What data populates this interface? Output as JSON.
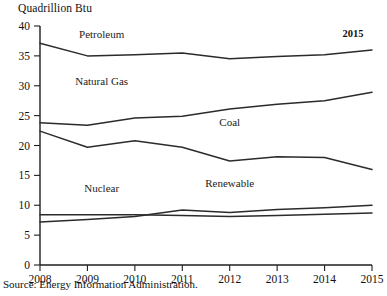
{
  "figure": {
    "unit_label": "Quadrillion Btu",
    "source_note": "Source: Energy Information Administration.",
    "end_year_annotation": "2015"
  },
  "chart_data": {
    "type": "line",
    "title": "",
    "subtitle": "",
    "xlabel": "",
    "ylabel": "Quadrillion Btu",
    "categories": [
      "2008",
      "2009",
      "2010",
      "2011",
      "2012",
      "2013",
      "2014",
      "2015"
    ],
    "x": [
      2008,
      2009,
      2010,
      2011,
      2012,
      2013,
      2014,
      2015
    ],
    "xlim": [
      2008,
      2015
    ],
    "ylim": [
      0,
      40
    ],
    "yticks": [
      0,
      5,
      10,
      15,
      20,
      25,
      30,
      35,
      40
    ],
    "ytick_labels": [
      "0",
      "5",
      "10",
      "15",
      "20",
      "25",
      "30",
      "35",
      "40"
    ],
    "xtick_labels": [
      "2008",
      "2009",
      "2010",
      "2011",
      "2012",
      "2013",
      "2014",
      "2015"
    ],
    "grid": false,
    "legend_position": "inline-labels",
    "annotations": [
      {
        "text": "2015",
        "x": 2014.6,
        "y": 38.2
      }
    ],
    "series": [
      {
        "name": "Petroleum",
        "label_x": 2009.3,
        "label_y": 38.0,
        "values": [
          37.1,
          35.0,
          35.2,
          35.5,
          34.5,
          34.9,
          35.2,
          36.0
        ]
      },
      {
        "name": "Natural Gas",
        "label_x": 2009.3,
        "label_y": 30.2,
        "values": [
          23.8,
          23.4,
          24.6,
          24.9,
          26.1,
          26.9,
          27.5,
          28.9
        ]
      },
      {
        "name": "Coal",
        "label_x": 2012.0,
        "label_y": 23.2,
        "values": [
          22.4,
          19.7,
          20.8,
          19.7,
          17.4,
          18.1,
          18.0,
          16.0
        ]
      },
      {
        "name": "Nuclear",
        "label_x": 2009.3,
        "label_y": 12.2,
        "values": [
          8.4,
          8.4,
          8.4,
          8.3,
          8.1,
          8.3,
          8.5,
          8.7
        ]
      },
      {
        "name": "Renewable",
        "label_x": 2012.0,
        "label_y": 13.0,
        "values": [
          7.2,
          7.6,
          8.1,
          9.2,
          8.8,
          9.3,
          9.6,
          10.0
        ]
      }
    ]
  }
}
